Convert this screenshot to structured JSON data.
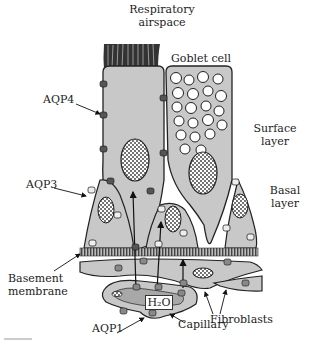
{
  "title": [
    "Respiratory",
    "airspace"
  ],
  "labels": {
    "goblet_cell": "Goblet cell",
    "aqp4": "AQP4",
    "aqp3": "AQP3",
    "surface_layer": [
      "Surface",
      "layer"
    ],
    "basal_layer": [
      "Basal",
      "layer"
    ],
    "basement_membrane": [
      "Basement",
      "membrane"
    ],
    "water": "H₂O",
    "fibroblasts": "Fibroblasts",
    "aqp1": "AQP1",
    "capillary": "Capillary"
  },
  "colors": {
    "cell_fill": "#c8c8c8",
    "capillary_inner": "#a8a8a8",
    "outline": "#222222",
    "membrane": "#555555",
    "background": "#ffffff"
  }
}
